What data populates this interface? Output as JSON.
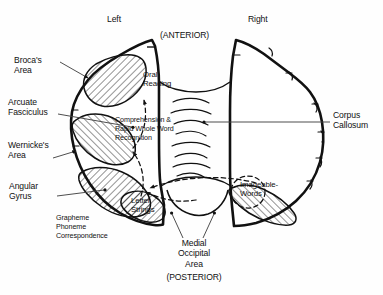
{
  "figure": {
    "background_color": "#fefefe",
    "ink_color": "#111111"
  },
  "orientation": {
    "left_hemisphere": "Left",
    "right_hemisphere": "Right",
    "anterior": "(ANTERIOR)",
    "posterior": "(POSTERIOR)"
  },
  "labels": {
    "brocas_area": "Broca's\nArea",
    "arcuate_fasciculus": "Arcuate\nFasciculus",
    "wernickes_area": "Wernicke's\nArea",
    "angular_gyrus": "Angular\nGyrus",
    "grapheme_phoneme": "Grapheme\nPhoneme\nCorrespondence",
    "corpus_callosum": "Corpus\nCallosum",
    "oral_reading": "Oral\nReading",
    "comprehension": "Comprehension &\nRapid Whole Word\nRecognition",
    "letter_strings": "Letter\nStrings",
    "imageable_words": "Imageable-\nWords",
    "medial_occipital": "Medial\nOccipital\nArea"
  },
  "regions": [
    {
      "name": "brocas-area",
      "hatched": true,
      "hemisphere": "left"
    },
    {
      "name": "wernickes-area",
      "hatched": true,
      "hemisphere": "left"
    },
    {
      "name": "angular-gyrus",
      "hatched": true,
      "hemisphere": "left"
    },
    {
      "name": "left-occipital",
      "hatched": true,
      "hemisphere": "left"
    },
    {
      "name": "right-occipital",
      "hatched": true,
      "hemisphere": "right"
    }
  ],
  "pathways": [
    {
      "name": "arcuate-fasciculus-anterior",
      "style": "dashed"
    },
    {
      "name": "arcuate-fasciculus-posterior",
      "style": "dashed"
    },
    {
      "name": "angular-to-occipital",
      "style": "dashed"
    },
    {
      "name": "interhemispheric-transfer",
      "style": "dashed"
    },
    {
      "name": "imageable-words-ellipse",
      "style": "dashed"
    }
  ]
}
